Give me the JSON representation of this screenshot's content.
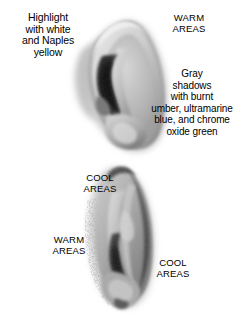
{
  "illustration": {
    "title": "Ear painting value study",
    "background_color": "#ffffff",
    "text_color": "#000000",
    "medium": "grayscale painted study",
    "subjects": [
      {
        "name": "upper-ear",
        "orientation": "three-quarter view, large scale",
        "tones": [
          "#f2f2f2",
          "#c9c9c9",
          "#9a9a9a",
          "#6b6b6b",
          "#3a3a3a",
          "#181818"
        ]
      },
      {
        "name": "lower-ear",
        "orientation": "near profile, elongated",
        "tones": [
          "#ececec",
          "#c2c2c2",
          "#969696",
          "#666666",
          "#3c3c3c",
          "#1f1f1f"
        ]
      }
    ]
  },
  "annotations": {
    "highlight_note": "Highlight\nwith white\nand Naples\nyellow",
    "warm_areas_top": "WARM\nAREAS",
    "gray_shadow_note": "Gray\nshadows\nwith burnt\number, ultramarine\nblue, and chrome\noxide green",
    "cool_areas_upper_left": "COOL\nAREAS",
    "warm_areas_lower_left": "WARM\nAREAS",
    "cool_areas_lower_right": "COOL\nAREAS"
  },
  "palette_mentioned": {
    "highlight_colors": [
      "white",
      "Naples yellow"
    ],
    "shadow_colors": [
      "burnt umber",
      "ultramarine blue",
      "chrome oxide green"
    ]
  }
}
